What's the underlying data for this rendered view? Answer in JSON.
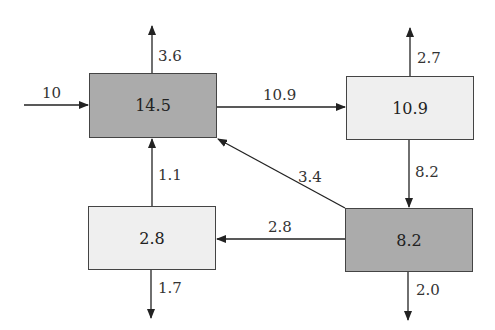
{
  "diagram": {
    "type": "flow-balance",
    "nodes": [
      {
        "id": "A",
        "value": "14.5",
        "shade": "dark"
      },
      {
        "id": "B",
        "value": "10.9",
        "shade": "light"
      },
      {
        "id": "C",
        "value": "2.8",
        "shade": "light"
      },
      {
        "id": "D",
        "value": "8.2",
        "shade": "dark"
      }
    ],
    "edges": [
      {
        "from": "external",
        "to": "A",
        "label": "10"
      },
      {
        "from": "A",
        "to": "external",
        "label": "3.6"
      },
      {
        "from": "A",
        "to": "B",
        "label": "10.9"
      },
      {
        "from": "B",
        "to": "external",
        "label": "2.7"
      },
      {
        "from": "B",
        "to": "D",
        "label": "8.2"
      },
      {
        "from": "D",
        "to": "A",
        "label": "3.4"
      },
      {
        "from": "D",
        "to": "C",
        "label": "2.8"
      },
      {
        "from": "C",
        "to": "A",
        "label": "1.1"
      },
      {
        "from": "C",
        "to": "external",
        "label": "1.7"
      },
      {
        "from": "D",
        "to": "external",
        "label": "2.0"
      }
    ]
  },
  "colors": {
    "dark_fill": "#ababab",
    "light_fill": "#efefef",
    "stroke": "#222222"
  }
}
